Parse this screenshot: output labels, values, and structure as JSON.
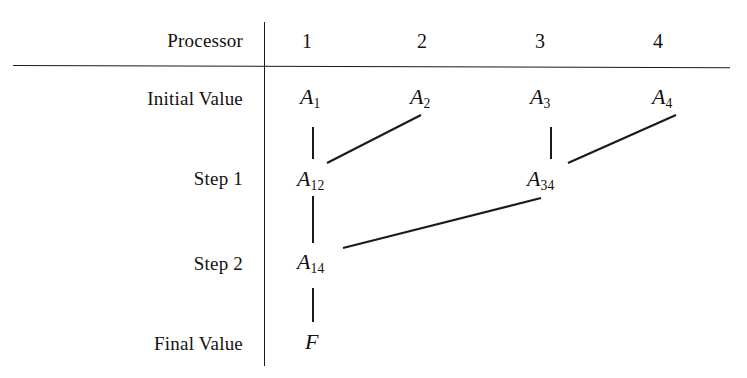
{
  "figure": {
    "kind": "parallel-reduction-tree",
    "width": 747,
    "height": 378,
    "background": "#ffffff",
    "ink_color": "#1a1a1a"
  },
  "header": {
    "corner_label": "Processor",
    "columns": [
      {
        "label": "1",
        "x": 307
      },
      {
        "label": "2",
        "x": 422
      },
      {
        "label": "3",
        "x": 540
      },
      {
        "label": "4",
        "x": 658
      }
    ]
  },
  "rows": [
    {
      "key": "initial",
      "label": "Initial Value",
      "y": 98
    },
    {
      "key": "step1",
      "label": "Step 1",
      "y": 178
    },
    {
      "key": "step2",
      "label": "Step 2",
      "y": 263
    },
    {
      "key": "final",
      "label": "Final Value",
      "y": 343
    }
  ],
  "nodes": [
    {
      "id": "A1",
      "base": "A",
      "sub": "1",
      "row": "initial",
      "col": 1,
      "x": 300,
      "y": 98
    },
    {
      "id": "A2",
      "base": "A",
      "sub": "2",
      "row": "initial",
      "col": 2,
      "x": 410,
      "y": 98
    },
    {
      "id": "A3",
      "base": "A",
      "sub": "3",
      "row": "initial",
      "col": 3,
      "x": 530,
      "y": 98
    },
    {
      "id": "A4",
      "base": "A",
      "sub": "4",
      "row": "initial",
      "col": 4,
      "x": 652,
      "y": 98
    },
    {
      "id": "A12",
      "base": "A",
      "sub": "12",
      "row": "step1",
      "col": 1,
      "x": 297,
      "y": 180
    },
    {
      "id": "A34",
      "base": "A",
      "sub": "34",
      "row": "step1",
      "col": 3,
      "x": 527,
      "y": 180
    },
    {
      "id": "A14",
      "base": "A",
      "sub": "14",
      "row": "step2",
      "col": 1,
      "x": 297,
      "y": 263
    },
    {
      "id": "F",
      "base": "F",
      "sub": "",
      "row": "final",
      "col": 1,
      "x": 305,
      "y": 343
    }
  ],
  "connectors": [
    {
      "id": "A1-to-A12",
      "type": "vertical",
      "x1": 313,
      "y1": 127,
      "x2": 313,
      "y2": 159
    },
    {
      "id": "A2-to-A12",
      "type": "diagonal",
      "x1": 421,
      "y1": 115,
      "x2": 327,
      "y2": 163
    },
    {
      "id": "A3-to-A34",
      "type": "vertical",
      "x1": 551,
      "y1": 127,
      "x2": 551,
      "y2": 159
    },
    {
      "id": "A4-to-A34",
      "type": "diagonal",
      "x1": 676,
      "y1": 115,
      "x2": 568,
      "y2": 163
    },
    {
      "id": "A12-to-A14",
      "type": "vertical",
      "x1": 313,
      "y1": 196,
      "x2": 313,
      "y2": 243
    },
    {
      "id": "A34-to-A14",
      "type": "diagonal",
      "x1": 541,
      "y1": 198,
      "x2": 343,
      "y2": 248
    },
    {
      "id": "A14-to-F",
      "type": "vertical",
      "x1": 313,
      "y1": 288,
      "x2": 313,
      "y2": 322
    }
  ]
}
